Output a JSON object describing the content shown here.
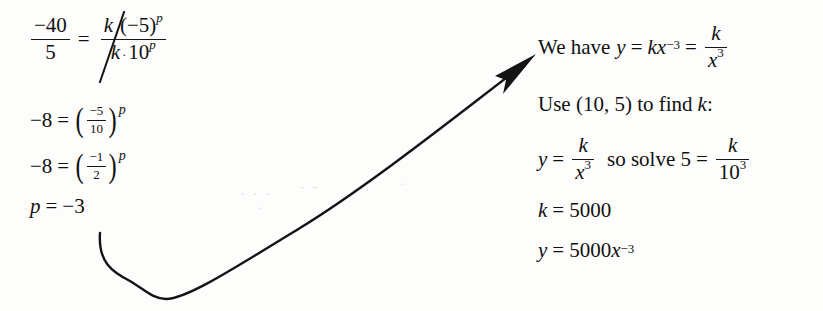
{
  "page": {
    "background_color": "#fdfdfc",
    "ink_color": "#111111",
    "width": 823,
    "height": 311
  },
  "left_work": {
    "line1": {
      "lhs_numerator": "−40",
      "lhs_denominator": "5",
      "equals": "=",
      "rhs_numerator_k": "k",
      "rhs_numerator_rest": "(−5)",
      "rhs_numerator_exp": "p",
      "rhs_denominator_k": "k",
      "rhs_denominator_dot": "·",
      "rhs_denominator_base": "10",
      "rhs_denominator_exp": "p",
      "cancel_note": "k cancelled by diagonal stroke"
    },
    "line2": {
      "lhs": "−8",
      "equals": "=",
      "numerator": "−5",
      "denominator": "10",
      "exponent": "p"
    },
    "line3": {
      "lhs": "−8",
      "equals": "=",
      "numerator": "−1",
      "denominator": "2",
      "exponent": "p"
    },
    "line4": {
      "variable": "p",
      "equals": "=",
      "value": "−3"
    }
  },
  "right_work": {
    "line1": {
      "prefix": "We have",
      "y": "y",
      "eq1": "=",
      "kx": "kx",
      "exp": "−3",
      "eq2": "=",
      "numerator": "k",
      "denominator_base": "x",
      "denominator_exp": "3"
    },
    "line2": {
      "text_a": "Use (10, 5) to find",
      "k": "k",
      "colon": ":"
    },
    "line3": {
      "y": "y",
      "eq1": "=",
      "numerator": "k",
      "denominator_base": "x",
      "denominator_exp": "3",
      "connector": "so solve 5",
      "eq2": "=",
      "numerator2": "k",
      "denominator2_base": "10",
      "denominator2_exp": "3"
    },
    "line4": {
      "k": "k",
      "equals": "=",
      "value": "5000"
    },
    "line5": {
      "y": "y",
      "equals": "=",
      "coefficient": "5000",
      "variable": "x",
      "exponent": "−3"
    }
  },
  "annotation": {
    "arrow": {
      "description": "curved arrow from below p = −3 sweeping right and up to the right-hand work",
      "start": [
        100,
        235
      ],
      "end": [
        536,
        56
      ]
    }
  }
}
